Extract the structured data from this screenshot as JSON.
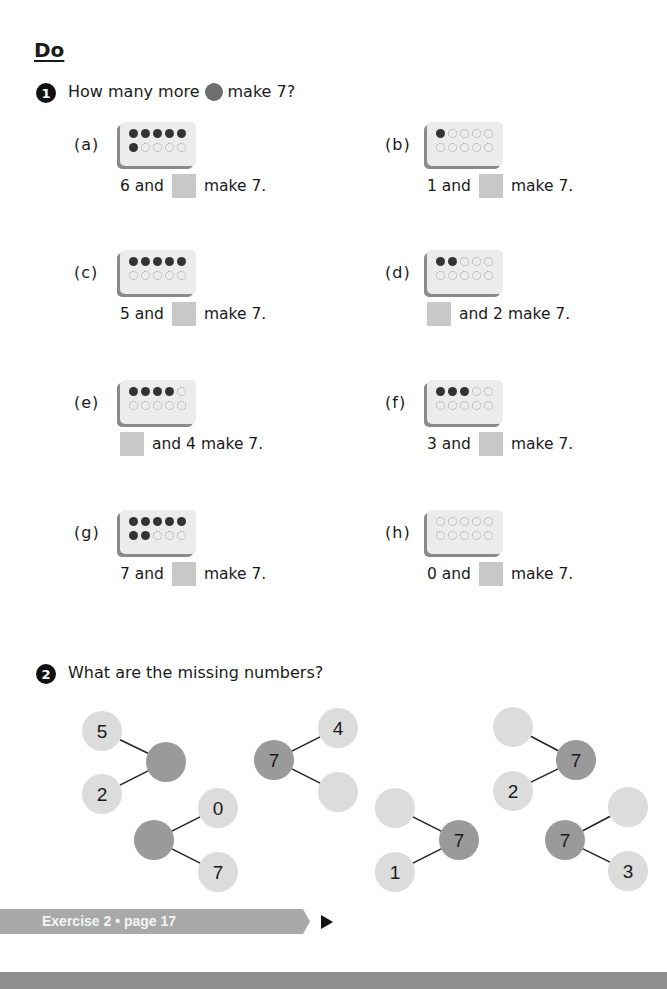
{
  "heading": "Do",
  "question1": {
    "number": "1",
    "text_before": "How many more",
    "icon": "counter-dot-icon",
    "text_after": "make 7?",
    "items": [
      {
        "label": "(a)",
        "top_filled": 5,
        "bottom_filled": 1,
        "sentence_before": "6 and",
        "sentence_after": "make 7.",
        "blank_first": false
      },
      {
        "label": "(b)",
        "top_filled": 1,
        "bottom_filled": 0,
        "sentence_before": "1 and",
        "sentence_after": "make 7.",
        "blank_first": false
      },
      {
        "label": "(c)",
        "top_filled": 5,
        "bottom_filled": 0,
        "sentence_before": "5 and",
        "sentence_after": "make 7.",
        "blank_first": false
      },
      {
        "label": "(d)",
        "top_filled": 2,
        "bottom_filled": 0,
        "sentence_before": "",
        "sentence_after": "and 2 make 7.",
        "blank_first": true
      },
      {
        "label": "(e)",
        "top_filled": 4,
        "bottom_filled": 0,
        "sentence_before": "",
        "sentence_after": "and 4 make 7.",
        "blank_first": true
      },
      {
        "label": "(f)",
        "top_filled": 3,
        "bottom_filled": 0,
        "sentence_before": "3 and",
        "sentence_after": "make 7.",
        "blank_first": false
      },
      {
        "label": "(g)",
        "top_filled": 5,
        "bottom_filled": 2,
        "sentence_before": "7 and",
        "sentence_after": "make 7.",
        "blank_first": false
      },
      {
        "label": "(h)",
        "top_filled": 0,
        "bottom_filled": 0,
        "sentence_before": "0 and",
        "sentence_after": "make 7.",
        "blank_first": false
      }
    ]
  },
  "question2": {
    "number": "2",
    "text": "What are the missing numbers?",
    "bonds": [
      {
        "whole": "",
        "parts": [
          "5",
          "2"
        ],
        "whole_side": "right",
        "whole_pos": [
          166,
          762
        ],
        "part_pos": [
          [
            102,
            731
          ],
          [
            102,
            794
          ]
        ]
      },
      {
        "whole": "",
        "parts": [
          "0",
          "7"
        ],
        "whole_side": "left",
        "whole_pos": [
          154,
          840
        ],
        "part_pos": [
          [
            218,
            808
          ],
          [
            218,
            872
          ]
        ]
      },
      {
        "whole": "7",
        "parts": [
          "4",
          ""
        ],
        "whole_side": "left",
        "whole_pos": [
          274,
          760
        ],
        "part_pos": [
          [
            338,
            728
          ],
          [
            338,
            792
          ]
        ]
      },
      {
        "whole": "7",
        "parts": [
          "",
          "1"
        ],
        "whole_side": "right",
        "whole_pos": [
          459,
          840
        ],
        "part_pos": [
          [
            395,
            808
          ],
          [
            395,
            872
          ]
        ]
      },
      {
        "whole": "7",
        "parts": [
          "",
          "2"
        ],
        "whole_side": "right",
        "whole_pos": [
          576,
          760
        ],
        "part_pos": [
          [
            513,
            727
          ],
          [
            513,
            791
          ]
        ]
      },
      {
        "whole": "7",
        "parts": [
          "",
          "3"
        ],
        "whole_side": "left",
        "whole_pos": [
          565,
          840
        ],
        "part_pos": [
          [
            628,
            807
          ],
          [
            628,
            871
          ]
        ]
      }
    ],
    "colors": {
      "whole": "#9a9a9a",
      "part": "#dcdcdc",
      "line": "#222222"
    }
  },
  "footer": {
    "label": "Exercise 2 • page 17",
    "arrow_icon": "play-arrow-icon"
  }
}
